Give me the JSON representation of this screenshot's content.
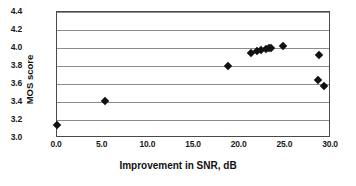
{
  "chart_data": {
    "type": "scatter",
    "title": "",
    "xlabel": "Improvement in SNR, dB",
    "ylabel": "MOS score",
    "xlim": [
      0.0,
      30.0
    ],
    "ylim": [
      3.0,
      4.4
    ],
    "xticks": [
      "0.0",
      "5.0",
      "10.0",
      "15.0",
      "20.0",
      "25.0",
      "30.0"
    ],
    "xtick_values": [
      0.0,
      5.0,
      10.0,
      15.0,
      20.0,
      25.0,
      30.0
    ],
    "yticks": [
      "3.0",
      "3.2",
      "3.4",
      "3.6",
      "3.8",
      "4.0",
      "4.2",
      "4.4"
    ],
    "ytick_values": [
      3.0,
      3.2,
      3.4,
      3.6,
      3.8,
      4.0,
      4.2,
      4.4
    ],
    "grid": "horizontal",
    "legend": null,
    "marker": "diamond",
    "marker_color": "#111111",
    "series": [
      {
        "name": "MOS vs SNR improvement",
        "points": [
          {
            "x": 0.0,
            "y": 3.14
          },
          {
            "x": 5.3,
            "y": 3.41
          },
          {
            "x": 18.7,
            "y": 3.8
          },
          {
            "x": 21.2,
            "y": 3.95
          },
          {
            "x": 21.9,
            "y": 3.97
          },
          {
            "x": 22.3,
            "y": 3.98
          },
          {
            "x": 22.9,
            "y": 3.99
          },
          {
            "x": 23.2,
            "y": 4.0
          },
          {
            "x": 23.4,
            "y": 4.0
          },
          {
            "x": 24.7,
            "y": 4.02
          },
          {
            "x": 28.7,
            "y": 3.92
          },
          {
            "x": 28.6,
            "y": 3.64
          },
          {
            "x": 29.2,
            "y": 3.58
          }
        ]
      }
    ]
  }
}
